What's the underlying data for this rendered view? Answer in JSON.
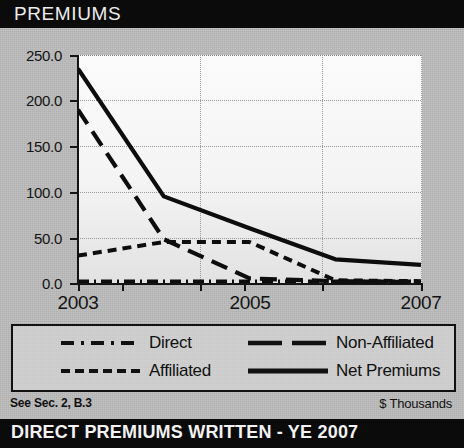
{
  "header": {
    "title": "PREMIUMS"
  },
  "footer": {
    "left_note": "See Sec. 2, B.3",
    "units": "$ Thousands",
    "banner": "DIRECT PREMIUMS WRITTEN - YE 2007"
  },
  "legend": {
    "items": [
      {
        "label": "Direct",
        "style": "dash-dot"
      },
      {
        "label": "Non-Affiliated",
        "style": "long-dash"
      },
      {
        "label": "Affiliated",
        "style": "short-dash"
      },
      {
        "label": "Net Premiums",
        "style": "solid"
      }
    ]
  },
  "chart_data": {
    "type": "line",
    "title": "PREMIUMS",
    "subtitle": "DIRECT PREMIUMS WRITTEN - YE 2007",
    "xlabel": "",
    "ylabel": "$ Thousands",
    "x": [
      2003,
      2004,
      2005,
      2006,
      2007
    ],
    "xticks": [
      "2003",
      "",
      "2005",
      "",
      "2007"
    ],
    "xtick_labels_shown": [
      "2003",
      "2005",
      "2007"
    ],
    "yticks": [
      0.0,
      50.0,
      100.0,
      150.0,
      200.0,
      250.0
    ],
    "ytick_labels": [
      "0.0",
      "50.0",
      "100.0",
      "150.0",
      "200.0",
      "250.0"
    ],
    "ylim": [
      0,
      250
    ],
    "xlim": [
      2003,
      2007
    ],
    "grid": true,
    "legend_position": "below-plot",
    "series": [
      {
        "name": "Net Premiums",
        "style": "solid",
        "values": [
          235,
          95,
          60,
          26,
          20
        ]
      },
      {
        "name": "Non-Affiliated",
        "style": "long-dash",
        "values": [
          190,
          48,
          5,
          2,
          1
        ]
      },
      {
        "name": "Affiliated",
        "style": "short-dash",
        "values": [
          30,
          45,
          45,
          3,
          2
        ]
      },
      {
        "name": "Direct",
        "style": "dash-dot",
        "values": [
          2,
          2,
          2,
          2,
          2
        ]
      }
    ]
  }
}
